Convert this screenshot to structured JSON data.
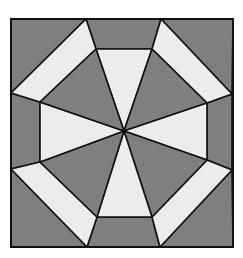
{
  "diagram": {
    "title": "",
    "colors": {
      "dark": "#7f7f7f",
      "light": "#ececec",
      "stroke": "#111111",
      "background": "#ffffff"
    },
    "square": {
      "x1": 11,
      "y1": 19,
      "x2": 233,
      "y2": 247
    },
    "center": [
      124,
      131
    ],
    "outer_octagon": [
      [
        86,
        19
      ],
      [
        161,
        19
      ],
      [
        232,
        94
      ],
      [
        232,
        170
      ],
      [
        160,
        247
      ],
      [
        87,
        247
      ],
      [
        11,
        169
      ],
      [
        11,
        93
      ]
    ],
    "inner_octagon": [
      [
        96,
        49
      ],
      [
        152,
        49
      ],
      [
        207,
        103
      ],
      [
        207,
        160
      ],
      [
        152,
        217
      ],
      [
        97,
        217
      ],
      [
        40,
        162
      ],
      [
        40,
        102
      ]
    ],
    "regions": {
      "corner_triangles": "dark",
      "axis_trapezoids": "dark",
      "diagonal_trapezoids": "light",
      "axis_center_triangles": "light",
      "diagonal_center_triangles": "dark"
    }
  }
}
